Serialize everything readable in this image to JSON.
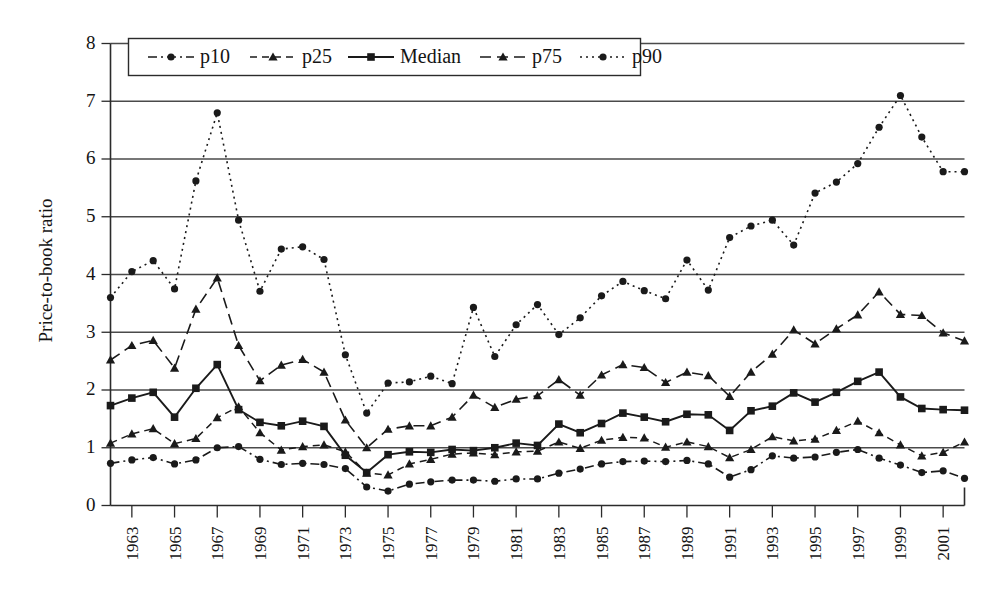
{
  "chart_data": {
    "type": "line",
    "title": "",
    "xlabel": "",
    "ylabel": "Price-to-book ratio",
    "ylim": [
      0,
      8
    ],
    "yticks": [
      0,
      1,
      2,
      3,
      4,
      5,
      6,
      7,
      8
    ],
    "ytick_labels": [
      "0",
      "1",
      "2",
      "3",
      "4",
      "5",
      "6",
      "7",
      "8"
    ],
    "grid": true,
    "grid_axis": "y",
    "legend_position": "top-left",
    "x_start": 1962,
    "x_end": 2002,
    "x": [
      1962,
      1963,
      1964,
      1965,
      1966,
      1967,
      1968,
      1969,
      1970,
      1971,
      1972,
      1973,
      1974,
      1975,
      1976,
      1977,
      1978,
      1979,
      1980,
      1981,
      1982,
      1983,
      1984,
      1985,
      1986,
      1987,
      1988,
      1989,
      1990,
      1991,
      1992,
      1993,
      1994,
      1995,
      1996,
      1997,
      1998,
      1999,
      2000,
      2001,
      2002
    ],
    "xtick_labels": [
      "1963",
      "1965",
      "1967",
      "1969",
      "1971",
      "1973",
      "1975",
      "1977",
      "1979",
      "1981",
      "1983",
      "1985",
      "1987",
      "1989",
      "1991",
      "1993",
      "1995",
      "1997",
      "1999",
      "2001"
    ],
    "xticks": [
      1963,
      1965,
      1967,
      1969,
      1971,
      1973,
      1975,
      1977,
      1979,
      1981,
      1983,
      1985,
      1987,
      1989,
      1991,
      1993,
      1995,
      1997,
      1999,
      2001
    ],
    "series": [
      {
        "name": "p10",
        "marker": "circle",
        "dash": "dash-dot",
        "values": [
          0.73,
          0.79,
          0.83,
          0.72,
          0.79,
          1.0,
          1.02,
          0.8,
          0.71,
          0.73,
          0.71,
          0.64,
          0.32,
          0.25,
          0.37,
          0.41,
          0.44,
          0.44,
          0.42,
          0.46,
          0.46,
          0.56,
          0.63,
          0.72,
          0.76,
          0.77,
          0.76,
          0.78,
          0.72,
          0.49,
          0.62,
          0.86,
          0.82,
          0.84,
          0.92,
          0.97,
          0.82,
          0.7,
          0.57,
          0.6,
          0.47
        ]
      },
      {
        "name": "p25",
        "marker": "triangle",
        "dash": "dash-short",
        "values": [
          1.08,
          1.24,
          1.33,
          1.07,
          1.16,
          1.52,
          1.71,
          1.26,
          0.96,
          1.02,
          1.05,
          0.93,
          0.56,
          0.53,
          0.72,
          0.8,
          0.89,
          0.91,
          0.88,
          0.93,
          0.94,
          1.1,
          0.99,
          1.13,
          1.18,
          1.17,
          1.01,
          1.1,
          1.02,
          0.83,
          0.97,
          1.19,
          1.12,
          1.15,
          1.3,
          1.46,
          1.26,
          1.05,
          0.86,
          0.92,
          1.1
        ]
      },
      {
        "name": "Median",
        "marker": "square",
        "dash": "solid",
        "values": [
          1.73,
          1.86,
          1.96,
          1.53,
          2.03,
          2.44,
          1.66,
          1.44,
          1.38,
          1.46,
          1.37,
          0.87,
          0.57,
          0.88,
          0.93,
          0.92,
          0.97,
          0.95,
          1.0,
          1.08,
          1.04,
          1.41,
          1.26,
          1.42,
          1.6,
          1.53,
          1.45,
          1.58,
          1.57,
          1.3,
          1.64,
          1.72,
          1.95,
          1.79,
          1.96,
          2.15,
          2.31,
          1.88,
          1.68,
          1.66,
          1.65
        ]
      },
      {
        "name": "p75",
        "marker": "triangle",
        "dash": "dash-long",
        "values": [
          2.52,
          2.77,
          2.86,
          2.38,
          3.4,
          3.94,
          2.77,
          2.16,
          2.43,
          2.53,
          2.31,
          1.48,
          1.0,
          1.32,
          1.38,
          1.38,
          1.53,
          1.91,
          1.7,
          1.84,
          1.9,
          2.18,
          1.91,
          2.26,
          2.44,
          2.39,
          2.13,
          2.31,
          2.25,
          1.89,
          2.31,
          2.62,
          3.04,
          2.8,
          3.06,
          3.3,
          3.7,
          3.31,
          3.29,
          2.99,
          2.85
        ]
      },
      {
        "name": "p90",
        "marker": "circle",
        "dash": "dotted",
        "values": [
          3.6,
          4.05,
          4.24,
          3.75,
          5.62,
          6.8,
          4.94,
          3.71,
          4.44,
          4.48,
          4.26,
          2.61,
          1.6,
          2.12,
          2.14,
          2.24,
          2.11,
          3.43,
          2.58,
          3.13,
          3.48,
          2.96,
          3.25,
          3.63,
          3.88,
          3.72,
          3.58,
          4.25,
          3.73,
          4.64,
          4.84,
          4.94,
          4.51,
          5.41,
          5.6,
          5.92,
          6.55,
          7.1,
          6.38,
          5.78,
          5.78
        ]
      }
    ]
  },
  "legend": {
    "items": [
      {
        "label": "p10"
      },
      {
        "label": "p25"
      },
      {
        "label": "Median"
      },
      {
        "label": "p75"
      },
      {
        "label": "p90"
      }
    ]
  }
}
